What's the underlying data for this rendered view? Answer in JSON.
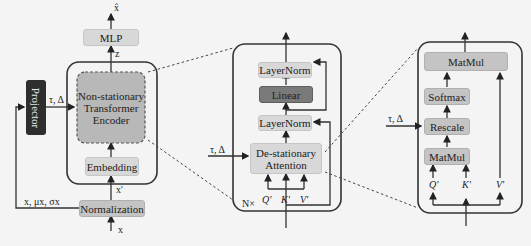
{
  "left": {
    "output_label": "x̂",
    "mlp": "MLP",
    "z_label": "z",
    "encoder": "Non-stationary Transformer Encoder",
    "embedding": "Embedding",
    "xprime_label": "x'",
    "normalization": "Normalization",
    "input_label": "x",
    "stats_label": "x, μx, σx",
    "projector": "Projector",
    "tau_delta_label": "τ, Δ"
  },
  "middle": {
    "layernorm_top": "LayerNorm",
    "linear": "Linear",
    "layernorm_bottom": "LayerNorm",
    "attention": "De-stationary Attention",
    "tau_delta_label": "τ, Δ",
    "q_label": "Q'",
    "k_label": "K'",
    "v_label": "V'",
    "repeat_label": "N×"
  },
  "right": {
    "matmul_top": "MatMul",
    "softmax": "Softmax",
    "rescale": "Rescale",
    "matmul_bottom": "MatMul",
    "tau_delta_label": "τ, Δ",
    "q_label": "Q'",
    "k_label": "K'",
    "v_label": "V'"
  },
  "colors": {
    "light_box": "#d8d8d8",
    "medium_box": "#c4c4c4",
    "dark_box": "#7a7a7a",
    "projector": "#2e2e2e",
    "line": "#333333"
  }
}
